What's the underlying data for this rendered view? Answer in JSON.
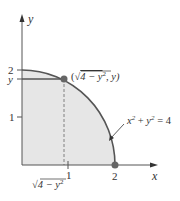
{
  "figure": {
    "axes": {
      "x_label": "x",
      "y_label": "y",
      "x_ticks": [
        "1",
        "2"
      ],
      "y_ticks": [
        "1",
        "2",
        "y"
      ]
    },
    "point_label": "(√4 − y², y)",
    "point_label_parts": {
      "open": "(",
      "sqrt": "√",
      "radicand": "4 − y",
      "exp": "2",
      "rest": ", y)"
    },
    "curve_equation": {
      "x": "x",
      "exp1": "2",
      "plus": " + ",
      "y": "y",
      "exp2": "2",
      "rest": " = 4"
    },
    "bottom_label": {
      "sqrt": "√",
      "radicand": "4 − y",
      "exp": "2"
    },
    "colors": {
      "region_fill": "#e6e6e6",
      "curve": "#555555",
      "axis": "#555555",
      "point": "#666666",
      "text": "#333333"
    }
  }
}
